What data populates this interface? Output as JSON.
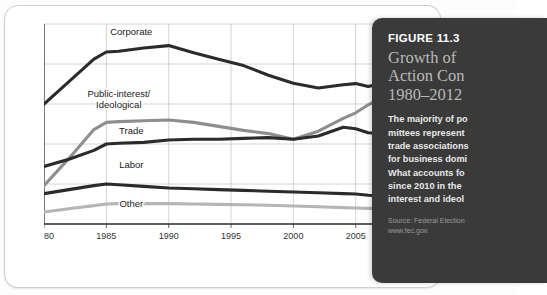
{
  "figure": {
    "number": "FIGURE 11.3",
    "title_lines": [
      "Growth of",
      "Action Con",
      "1980–2012"
    ],
    "body_lines": [
      "The majority of po",
      "mittees represent",
      "trade associations",
      "for business domi",
      "What accounts fo",
      "since 2010 in the",
      "interest and ideol"
    ],
    "source_lines": [
      "Source: Federal Election",
      "www.fec.gov."
    ]
  },
  "chart_data": {
    "type": "line",
    "title": "",
    "xlabel": "",
    "ylabel": "NUMBER OF PACS",
    "xlim": [
      1980,
      2012
    ],
    "ylim": [
      0,
      2500
    ],
    "grid": true,
    "legend": "inline-labels",
    "x_ticks": [
      "1980",
      "1985",
      "1990",
      "1995",
      "2000",
      "2005",
      "2010",
      "2012"
    ],
    "x_tick_values": [
      1980,
      1985,
      1990,
      1995,
      2000,
      2005,
      2010,
      2012
    ],
    "y_ticks": [
      "0",
      "500",
      "1,000",
      "1,500",
      "2,000",
      "2,500"
    ],
    "y_tick_values": [
      0,
      500,
      1000,
      1500,
      2000,
      2500
    ],
    "x": [
      1980,
      1982,
      1984,
      1985,
      1986,
      1988,
      1990,
      1992,
      1994,
      1996,
      1998,
      2000,
      2002,
      2004,
      2005,
      2006,
      2008,
      2010,
      2012
    ],
    "series": [
      {
        "name": "Corporate",
        "color": "#2b2b2b",
        "label_x": 1987,
        "label_y": 2360,
        "values": [
          1500,
          1780,
          2060,
          2150,
          2160,
          2200,
          2230,
          2140,
          2060,
          1980,
          1860,
          1760,
          1700,
          1740,
          1755,
          1720,
          1790,
          1950,
          1800
        ]
      },
      {
        "name": "Public-interest/\nIdeological",
        "color": "#8e8e8e",
        "label_x": 1986,
        "label_y": 1590,
        "values": [
          480,
          820,
          1180,
          1270,
          1280,
          1290,
          1300,
          1270,
          1220,
          1170,
          1130,
          1060,
          1160,
          1320,
          1390,
          1490,
          1650,
          1850,
          2430
        ]
      },
      {
        "name": "Trade",
        "color": "#2b2b2b",
        "label_x": 1987,
        "label_y": 1130,
        "values": [
          720,
          810,
          920,
          1000,
          1010,
          1020,
          1050,
          1060,
          1060,
          1070,
          1080,
          1060,
          1100,
          1210,
          1190,
          1140,
          1120,
          1080,
          1000
        ]
      },
      {
        "name": "Labor",
        "color": "#2b2b2b",
        "label_x": 1987,
        "label_y": 700,
        "values": [
          380,
          430,
          480,
          500,
          490,
          470,
          450,
          440,
          430,
          420,
          410,
          400,
          390,
          380,
          375,
          360,
          340,
          320,
          300
        ]
      },
      {
        "name": "Other",
        "color": "#b5b5b5",
        "label_x": 1987,
        "label_y": 210,
        "values": [
          150,
          190,
          230,
          250,
          255,
          255,
          255,
          250,
          245,
          240,
          235,
          225,
          215,
          205,
          200,
          195,
          200,
          215,
          225
        ]
      }
    ]
  }
}
